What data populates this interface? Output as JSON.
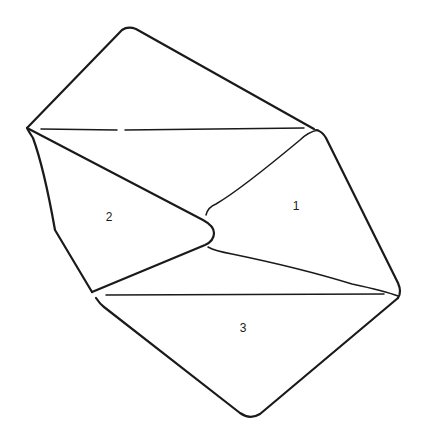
{
  "figure": {
    "type": "line-drawing",
    "stroke_color": "#1a1a1a",
    "background": "#ffffff",
    "labels": [
      {
        "id": "flap-1",
        "text": "1",
        "x": 296,
        "y": 210
      },
      {
        "id": "flap-2",
        "text": "2",
        "x": 109,
        "y": 221
      },
      {
        "id": "flap-3",
        "text": "3",
        "x": 243,
        "y": 332
      }
    ]
  }
}
